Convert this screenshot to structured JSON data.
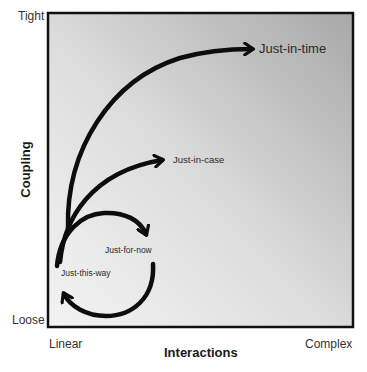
{
  "diagram": {
    "type": "conceptual-quadrant",
    "y_axis": {
      "title": "Coupling",
      "top_label": "Tight",
      "bottom_label": "Loose"
    },
    "x_axis": {
      "title": "Interactions",
      "left_label": "Linear",
      "right_label": "Complex"
    },
    "curves": [
      {
        "label": "Just-in-time",
        "description": "large arc from low-left rising to top-right"
      },
      {
        "label": "Just-in-case",
        "description": "medium arc from low-left to middle"
      },
      {
        "label": "Just-for-now",
        "description": "small arc curving right then down"
      },
      {
        "label": "Just-this-way",
        "description": "return arc curving down and back to left"
      }
    ],
    "colors": {
      "frame": "#111111",
      "arrow": "#0d0d0d",
      "gradient_light": "#f2f2f2",
      "gradient_dark": "#a9a9a9"
    }
  }
}
